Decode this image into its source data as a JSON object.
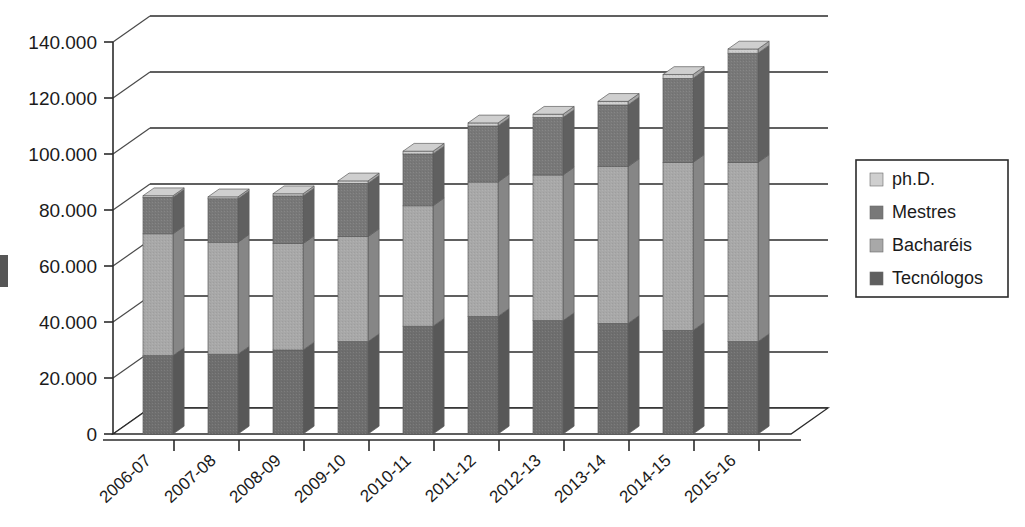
{
  "chart_data": {
    "type": "bar",
    "subtype": "stacked-bar-3d",
    "title": "",
    "subtitle": "",
    "xlabel": "",
    "ylabel": "",
    "categories": [
      "2006-07",
      "2007-08",
      "2008-09",
      "2009-10",
      "2010-11",
      "2011-12",
      "2012-13",
      "2013-14",
      "2014-15",
      "2015-16"
    ],
    "series": [
      {
        "name": "Tecnólogos",
        "color": "#6e6e6e",
        "values": [
          28000,
          28500,
          30000,
          33000,
          38500,
          42000,
          40500,
          39500,
          37000,
          33000
        ]
      },
      {
        "name": "Bacharéis",
        "color": "#a8a8a8",
        "values": [
          43500,
          40000,
          38000,
          37500,
          43000,
          48000,
          52000,
          56000,
          60000,
          64000
        ]
      },
      {
        "name": "Mestres",
        "color": "#787878",
        "values": [
          13000,
          15500,
          17000,
          19000,
          18500,
          20000,
          20500,
          22000,
          30000,
          39000
        ]
      },
      {
        "name": "ph.D.",
        "color": "#cfcfcf",
        "values": [
          600,
          700,
          800,
          900,
          1000,
          1100,
          1200,
          1300,
          1400,
          1500
        ]
      }
    ],
    "totals": [
      85100,
      84700,
      85800,
      90400,
      101000,
      111100,
      114200,
      118800,
      128400,
      137500
    ],
    "ylim": [
      0,
      145000
    ],
    "yticks": [
      0,
      20000,
      40000,
      60000,
      80000,
      100000,
      120000,
      140000
    ],
    "ytick_labels": [
      "0",
      "20.000",
      "40.000",
      "60.000",
      "80.000",
      "100.000",
      "120.000",
      "140.000"
    ],
    "grid": true,
    "legend_position": "right",
    "legend_entries": [
      "ph.D.",
      "Mestres",
      "Bacharéis",
      "Tecnólogos"
    ]
  },
  "legend": {
    "items": [
      {
        "label": "ph.D.",
        "color": "#cfcfcf"
      },
      {
        "label": "Mestres",
        "color": "#787878"
      },
      {
        "label": "Bacharéis",
        "color": "#a8a8a8"
      },
      {
        "label": "Tecnólogos",
        "color": "#5f5f5f"
      }
    ]
  },
  "axis": {
    "y_labels": [
      "140.000",
      "120.000",
      "100.000",
      "80.000",
      "60.000",
      "40.000",
      "20.000",
      "0"
    ],
    "x_labels": [
      "2006-07",
      "2007-08",
      "2008-09",
      "2009-10",
      "2010-11",
      "2011-12",
      "2012-13",
      "2013-14",
      "2014-15",
      "2015-16"
    ]
  },
  "colors": {
    "background": "#ffffff",
    "ink": "#1b1b1b",
    "grid": "#2b2b2b",
    "phd": "#cfcfcf",
    "mestres": "#787878",
    "bachareis": "#a8a8a8",
    "tecnologos": "#5f5f5f"
  }
}
